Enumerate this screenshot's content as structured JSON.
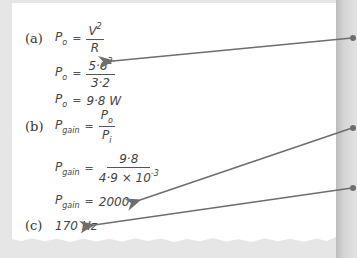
{
  "solution": {
    "part_a": {
      "label": "(a)",
      "line1": {
        "lhs": "P",
        "lhs_sub": "o",
        "eq": "=",
        "num": "V",
        "num_sup": "2",
        "den": "R"
      },
      "line2": {
        "lhs": "P",
        "lhs_sub": "o",
        "eq": "=",
        "num": "5·6",
        "num_sup": "2",
        "den": "3·2"
      },
      "line3": {
        "lhs": "P",
        "lhs_sub": "o",
        "eq": "=",
        "value": "9·8 W"
      }
    },
    "part_b": {
      "label": "(b)",
      "line1": {
        "lhs": "P",
        "lhs_sub": "gain",
        "eq": "=",
        "num": "P",
        "num_sub": "o",
        "den": "P",
        "den_sub": "i"
      },
      "line2": {
        "lhs": "P",
        "lhs_sub": "gain",
        "eq": "=",
        "num": "9·8",
        "den": "4·9 × 10",
        "den_sup": "-3"
      },
      "line3": {
        "lhs": "P",
        "lhs_sub": "gain",
        "eq": "=",
        "value": "2000"
      }
    },
    "part_c": {
      "label": "(c)",
      "value": "170 Hz"
    }
  },
  "annotations": {
    "arrow_color": "#6e6e6e",
    "arrows": [
      {
        "target": "part-a-substitution"
      },
      {
        "target": "part-b-result"
      },
      {
        "target": "part-c-result"
      }
    ]
  }
}
